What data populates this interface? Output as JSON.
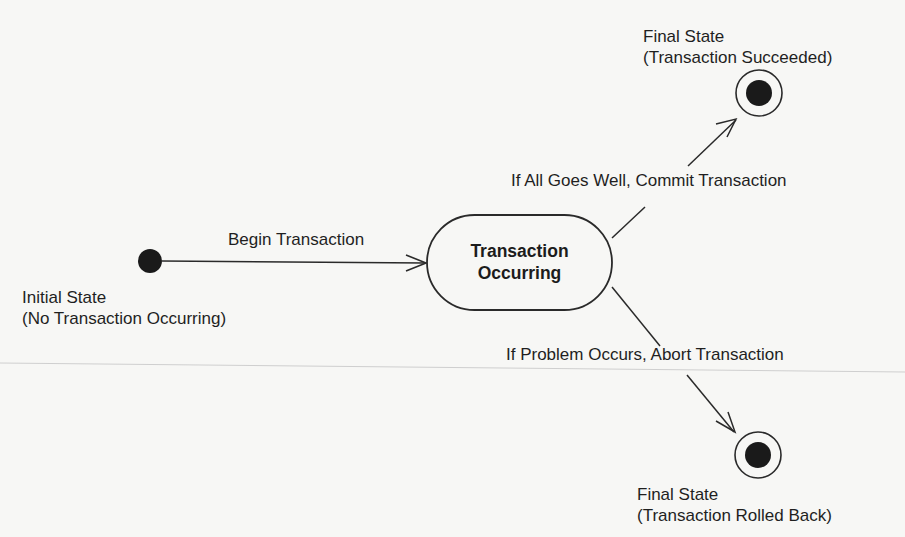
{
  "diagram": {
    "type": "uml-state-diagram",
    "colors": {
      "background": "#f7f7f5",
      "ink": "#1e1e1e",
      "scan_line": "#c8c8c8"
    },
    "initial_state": {
      "title": "Initial State",
      "subtitle": "(No Transaction Occurring)"
    },
    "state": {
      "line1": "Transaction",
      "line2": "Occurring"
    },
    "final_success": {
      "title": "Final State",
      "subtitle": "(Transaction Succeeded)"
    },
    "final_rollback": {
      "title": "Final State",
      "subtitle": "(Transaction Rolled Back)"
    },
    "transitions": {
      "begin": "Begin Transaction",
      "commit": "If All Goes Well, Commit Transaction",
      "abort": "If Problem Occurs, Abort Transaction"
    }
  }
}
